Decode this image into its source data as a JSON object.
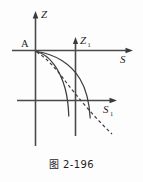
{
  "figure": {
    "caption": "图 2-196",
    "point_label": "A",
    "axes": [
      {
        "id": "z-axis",
        "label": "Z",
        "subscript": "",
        "orientation": "vertical",
        "direction": "up"
      },
      {
        "id": "s-axis",
        "label": "S",
        "subscript": "",
        "orientation": "horizontal",
        "direction": "right"
      },
      {
        "id": "z1-axis",
        "label": "Z",
        "subscript": "1",
        "orientation": "vertical",
        "direction": "up"
      },
      {
        "id": "s1-axis",
        "label": "S",
        "subscript": "1",
        "orientation": "horizontal",
        "direction": "right"
      }
    ],
    "colors": {
      "axis": "#4a4a4a",
      "curve": "#3d3d3d",
      "text": "#1d1d1d",
      "background": "#fdfdfd"
    },
    "curves": [
      {
        "id": "curve-inner",
        "style": "solid"
      },
      {
        "id": "curve-outer",
        "style": "solid"
      },
      {
        "id": "curve-asymptote",
        "style": "dashed"
      }
    ]
  }
}
